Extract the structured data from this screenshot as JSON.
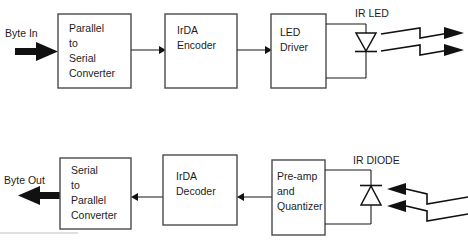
{
  "diagram": {
    "colors": {
      "background": "#ffffff",
      "box_stroke": "#4a4a4a",
      "wire": "#1a1a1a",
      "text": "#1d1d1d",
      "beam": "#111111",
      "faint_rule": "#bfbfbf"
    },
    "transmit_chain": {
      "input_port": "Byte In",
      "blocks": [
        {
          "id": "parallel-to-serial",
          "lines": [
            "Parallel",
            "to",
            "Serial",
            "Converter"
          ]
        },
        {
          "id": "irda-encoder",
          "lines": [
            "IrDA",
            "Encoder"
          ]
        },
        {
          "id": "led-driver",
          "lines": [
            "LED",
            "Driver"
          ]
        }
      ],
      "device_label": "IR LED",
      "beam_count": 2,
      "beam_direction": "outgoing"
    },
    "receive_chain": {
      "output_port": "Byte Out",
      "blocks": [
        {
          "id": "serial-to-parallel",
          "lines": [
            "Serial",
            "to",
            "Parallel",
            "Converter"
          ]
        },
        {
          "id": "irda-decoder",
          "lines": [
            "IrDA",
            "Decoder"
          ]
        },
        {
          "id": "preamp-quantizer",
          "lines": [
            "Pre-amp",
            "and",
            "Quantizer"
          ]
        }
      ],
      "device_label": "IR DIODE",
      "beam_count": 2,
      "beam_direction": "incoming"
    }
  }
}
